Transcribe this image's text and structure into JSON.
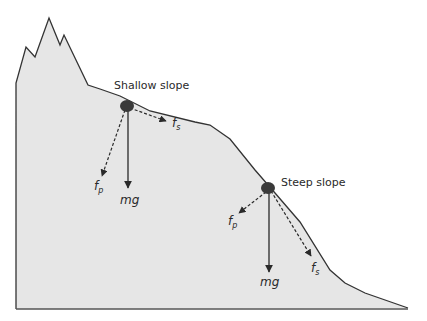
{
  "figure": {
    "colors": {
      "terrain_fill": "#e6e6e6",
      "outline": "#333333",
      "arrow": "#2a2a2a",
      "rock": "#3a3a3a"
    },
    "labels": {
      "shallow_slope": "Shallow slope",
      "steep_slope": "Steep slope"
    },
    "shallow_forces": {
      "weight": {
        "main": "mg"
      },
      "parallel": {
        "main": "f",
        "sub": "s"
      },
      "perpendicular": {
        "main": "f",
        "sub": "p"
      }
    },
    "steep_forces": {
      "weight": {
        "main": "mg"
      },
      "parallel": {
        "main": "f",
        "sub": "s"
      },
      "perpendicular": {
        "main": "f",
        "sub": "p"
      }
    }
  }
}
